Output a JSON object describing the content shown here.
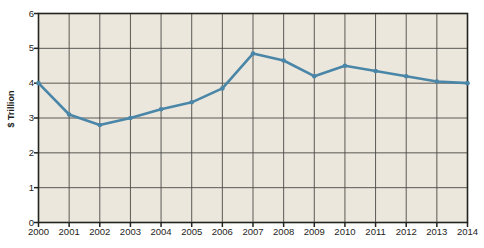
{
  "chart_data": {
    "type": "line",
    "title": "",
    "xlabel": "",
    "ylabel": "$ Trillion",
    "categories": [
      "2000",
      "2001",
      "2002",
      "2003",
      "2004",
      "2005",
      "2006",
      "2007",
      "2008",
      "2009",
      "2010",
      "2011",
      "2012",
      "2013",
      "2014"
    ],
    "values": [
      4.0,
      3.1,
      2.8,
      3.0,
      3.25,
      3.45,
      3.85,
      4.85,
      4.65,
      4.2,
      4.5,
      4.35,
      4.2,
      4.05,
      4.0
    ],
    "series": [
      {
        "name": "value",
        "values": [
          4.0,
          3.1,
          2.8,
          3.0,
          3.25,
          3.45,
          3.85,
          4.85,
          4.65,
          4.2,
          4.5,
          4.35,
          4.2,
          4.05,
          4.0
        ]
      }
    ],
    "ylim": [
      0,
      6
    ],
    "yticks": [
      0,
      1,
      2,
      3,
      4,
      5,
      6
    ],
    "ytick_labels": [
      "0",
      "1",
      "2",
      "3",
      "4",
      "5",
      "6"
    ],
    "grid": "both",
    "legend": "none",
    "colors": {
      "line": "#4a86a8",
      "marker": "#4a86a8",
      "plot_background": "#ece7dc",
      "gridline": "#4a4a45",
      "axis": "#23231f",
      "text": "#1d1d1b"
    }
  },
  "axes": {
    "y_title": "$ Trillion"
  }
}
